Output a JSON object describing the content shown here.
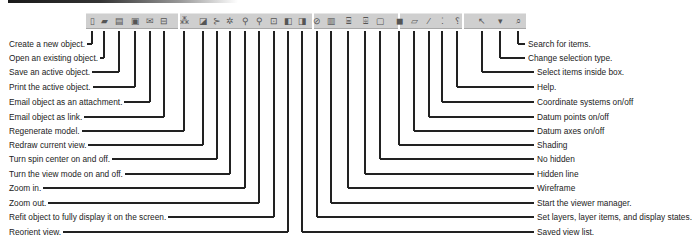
{
  "toolbar": {
    "buttons": [
      {
        "id": "new",
        "icon": "new-document-icon",
        "glyph": "▯",
        "x": 92
      },
      {
        "id": "open",
        "icon": "open-folder-icon",
        "glyph": "▰",
        "x": 104
      },
      {
        "id": "save",
        "icon": "save-icon",
        "glyph": "▤",
        "x": 119
      },
      {
        "id": "print",
        "icon": "printer-icon",
        "glyph": "▣",
        "x": 135
      },
      {
        "id": "email_attach",
        "icon": "email-attachment-icon",
        "glyph": "✉",
        "x": 150
      },
      {
        "id": "email_link",
        "icon": "email-link-icon",
        "glyph": "⊟",
        "x": 164
      },
      {
        "id": "regen",
        "icon": "regenerate-icon",
        "glyph": "⁂",
        "x": 184
      },
      {
        "id": "redraw",
        "icon": "redraw-icon",
        "glyph": "◪",
        "x": 203
      },
      {
        "id": "spin",
        "icon": "spin-center-icon",
        "glyph": "⊱",
        "x": 217
      },
      {
        "id": "view_mode",
        "icon": "view-mode-icon",
        "glyph": "✲",
        "x": 230
      },
      {
        "id": "zoom_in",
        "icon": "zoom-in-icon",
        "glyph": "⚲",
        "x": 245
      },
      {
        "id": "zoom_out",
        "icon": "zoom-out-icon",
        "glyph": "⚲",
        "x": 259
      },
      {
        "id": "refit",
        "icon": "refit-icon",
        "glyph": "⊡",
        "x": 274
      },
      {
        "id": "reorient",
        "icon": "reorient-icon",
        "glyph": "◧",
        "x": 288
      },
      {
        "id": "saved_views",
        "icon": "saved-views-icon",
        "glyph": "◨",
        "x": 302
      },
      {
        "id": "layers",
        "icon": "layers-icon",
        "glyph": "⊘",
        "x": 317
      },
      {
        "id": "viewer_manager",
        "icon": "viewer-manager-icon",
        "glyph": "▥",
        "x": 331
      },
      {
        "id": "wireframe",
        "icon": "wireframe-icon",
        "glyph": "⌸",
        "x": 348
      },
      {
        "id": "hidden_line",
        "icon": "hidden-line-icon",
        "glyph": "⌹",
        "x": 365
      },
      {
        "id": "no_hidden",
        "icon": "no-hidden-icon",
        "glyph": "▢",
        "x": 380
      },
      {
        "id": "shading",
        "icon": "shading-icon",
        "glyph": "◼",
        "x": 399
      },
      {
        "id": "datum_axes",
        "icon": "datum-axes-icon",
        "glyph": "⏥",
        "x": 414
      },
      {
        "id": "datum_points",
        "icon": "datum-points-icon",
        "glyph": "⁄",
        "x": 429
      },
      {
        "id": "csys",
        "icon": "coordinate-systems-icon",
        "glyph": "⁚",
        "x": 442
      },
      {
        "id": "help",
        "icon": "help-icon",
        "glyph": "⸮",
        "x": 457
      },
      {
        "id": "select_box",
        "icon": "select-box-icon",
        "glyph": "↖",
        "x": 482
      },
      {
        "id": "selection_type",
        "icon": "selection-type-dropdown-icon",
        "glyph": "▾",
        "x": 500
      },
      {
        "id": "search",
        "icon": "search-items-icon",
        "glyph": "⌕",
        "x": 518
      }
    ]
  },
  "callouts_left": [
    {
      "label": "Create a new object.",
      "line_x": 92,
      "y": 44
    },
    {
      "label": "Open an existing object.",
      "line_x": 104,
      "y": 58
    },
    {
      "label": "Save an active object.",
      "line_x": 119,
      "y": 72
    },
    {
      "label": "Print the active object.",
      "line_x": 135,
      "y": 87
    },
    {
      "label": "Email object as an attachment.",
      "line_x": 150,
      "y": 102
    },
    {
      "label": "Email object as link.",
      "line_x": 164,
      "y": 117
    },
    {
      "label": "Regenerate model.",
      "line_x": 184,
      "y": 131
    },
    {
      "label": "Redraw current view.",
      "line_x": 203,
      "y": 145
    },
    {
      "label": "Turn spin center on and off.",
      "line_x": 217,
      "y": 159
    },
    {
      "label": "Turn the view mode on and off.",
      "line_x": 230,
      "y": 174
    },
    {
      "label": "Zoom in.",
      "line_x": 245,
      "y": 188
    },
    {
      "label": "Zoom out.",
      "line_x": 259,
      "y": 203
    },
    {
      "label": "Refit object to fully display it on the screen.",
      "line_x": 274,
      "y": 217
    },
    {
      "label": "Reorient view.",
      "line_x": 288,
      "y": 232
    }
  ],
  "callouts_right": [
    {
      "label": "Search for items.",
      "line_x": 518,
      "y": 44
    },
    {
      "label": "Change selection type.",
      "line_x": 500,
      "y": 58
    },
    {
      "label": "Select items inside box.",
      "line_x": 482,
      "y": 72
    },
    {
      "label": "Help.",
      "line_x": 457,
      "y": 87
    },
    {
      "label": "Coordinate systems on/off",
      "line_x": 442,
      "y": 102
    },
    {
      "label": "Datum points on/off",
      "line_x": 429,
      "y": 117
    },
    {
      "label": "Datum axes on/off",
      "line_x": 414,
      "y": 131
    },
    {
      "label": "Shading",
      "line_x": 399,
      "y": 145
    },
    {
      "label": "No hidden",
      "line_x": 380,
      "y": 159
    },
    {
      "label": "Hidden line",
      "line_x": 365,
      "y": 174
    },
    {
      "label": "Wireframe",
      "line_x": 348,
      "y": 188
    },
    {
      "label": "Start the viewer manager.",
      "line_x": 331,
      "y": 203
    },
    {
      "label": "Set layers, layer items, and display states.",
      "line_x": 317,
      "y": 217
    },
    {
      "label": "Saved view list.",
      "line_x": 302,
      "y": 232
    }
  ],
  "colors": {
    "toolbar_bg": "#cfcfcf",
    "line": "#222222",
    "text": "#222222"
  }
}
